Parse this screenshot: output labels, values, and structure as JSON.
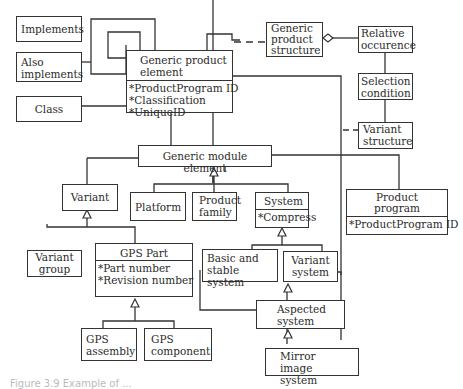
{
  "diagram": {
    "type": "uml-class-diagram",
    "classes": {
      "implements": {
        "title": "Implements"
      },
      "also_implements": {
        "title": "Also implements"
      },
      "class": {
        "title": "Class"
      },
      "generic_product_element": {
        "title": "Generic product element",
        "attributes": [
          "*ProductProgram ID",
          "*Classification",
          "*UniqueID"
        ]
      },
      "generic_product_structure": {
        "title": "Generic product structure"
      },
      "relative_occurence": {
        "title": "Relative occurence"
      },
      "selection_condition": {
        "title": "Selection condition"
      },
      "variant_structure": {
        "title": "Variant structure"
      },
      "generic_module_element": {
        "title": "Generic module element"
      },
      "variant": {
        "title": "Variant"
      },
      "platform": {
        "title": "Platform"
      },
      "product_family": {
        "title": "Product family"
      },
      "system": {
        "title": "System",
        "attributes": [
          "*Compress"
        ]
      },
      "product_program": {
        "title": "Product program",
        "attributes": [
          "*ProductProgram ID"
        ]
      },
      "variant_group": {
        "title": "Variant group"
      },
      "gps_part": {
        "title": "GPS Part",
        "attributes": [
          "*Part number",
          "*Revision number"
        ]
      },
      "basic_and_stable_system": {
        "title": "Basic and stable system"
      },
      "variant_system": {
        "title": "Variant system"
      },
      "aspected_system": {
        "title": "Aspected system"
      },
      "gps_assembly": {
        "title": "GPS assembly"
      },
      "gps_component": {
        "title": "GPS component"
      },
      "mirror_image_system": {
        "title": "Mirror image system"
      }
    },
    "relations": [
      {
        "from": "also_implements",
        "to": "generic_product_element",
        "kind": "association"
      },
      {
        "from": "class",
        "to": "generic_product_element",
        "kind": "association"
      },
      {
        "from": "generic_product_element",
        "to": "generic_product_element",
        "kind": "self-association"
      },
      {
        "from": "generic_product_element",
        "to": "generic_product_structure",
        "kind": "dashed"
      },
      {
        "from": "generic_product_structure",
        "to": "relative_occurence",
        "kind": "aggregation"
      },
      {
        "from": "relative_occurence",
        "to": "selection_condition",
        "kind": "association"
      },
      {
        "from": "selection_condition",
        "to": "variant_structure",
        "kind": "association"
      },
      {
        "from": "variant_structure",
        "to": "variant_system",
        "kind": "dashed"
      },
      {
        "from": "generic_product_element",
        "to": "variant",
        "kind": "association"
      },
      {
        "from": "generic_product_element",
        "to": "generic_module_element",
        "kind": "association"
      },
      {
        "from": "generic_module_element",
        "to": "product_program",
        "kind": "association"
      },
      {
        "from": "platform",
        "to": "generic_module_element",
        "kind": "generalization"
      },
      {
        "from": "product_family",
        "to": "generic_module_element",
        "kind": "generalization"
      },
      {
        "from": "system",
        "to": "generic_module_element",
        "kind": "generalization"
      },
      {
        "from": "variant_group",
        "to": "variant",
        "kind": "generalization"
      },
      {
        "from": "gps_part",
        "to": "variant",
        "kind": "generalization"
      },
      {
        "from": "basic_and_stable_system",
        "to": "system",
        "kind": "generalization"
      },
      {
        "from": "variant_system",
        "to": "system",
        "kind": "generalization"
      },
      {
        "from": "aspected_system",
        "to": "variant_system",
        "kind": "generalization"
      },
      {
        "from": "mirror_image_system",
        "to": "aspected_system",
        "kind": "generalization"
      },
      {
        "from": "gps_assembly",
        "to": "gps_part",
        "kind": "generalization"
      },
      {
        "from": "gps_component",
        "to": "gps_part",
        "kind": "generalization"
      },
      {
        "from": "gps_part",
        "to": "aspected_system",
        "kind": "association"
      }
    ],
    "caption": "Figure 3.9  Example of ..."
  }
}
